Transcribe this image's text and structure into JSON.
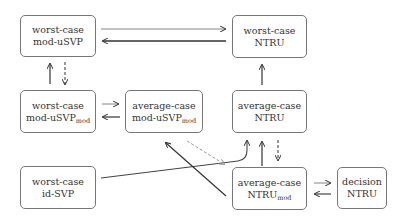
{
  "nodes": {
    "wc_moduSVP": {
      "line1": "worst-case",
      "line2": "mod-uSVP",
      "sub": ""
    },
    "wc_NTRU": {
      "line1": "worst-case",
      "line2": "NTRU",
      "sub": ""
    },
    "wc_moduSVPmod": {
      "line1": "worst-case",
      "line2": "mod-uSVP",
      "sub": "mod"
    },
    "ac_moduSVPmod": {
      "line1": "average-case",
      "line2": "mod-uSVP",
      "sub": "mod"
    },
    "ac_NTRU": {
      "line1": "average-case",
      "line2": "NTRU",
      "sub": ""
    },
    "wc_idSVP": {
      "line1": "worst-case",
      "line2": "id-SVP",
      "sub": ""
    },
    "ac_NTRUmod": {
      "line1": "average-case",
      "line2": "NTRU",
      "sub": "mod"
    },
    "dec_NTRU": {
      "line1": "decision",
      "line2": "NTRU",
      "sub": ""
    }
  },
  "edges": [
    {
      "from": "wc_moduSVP",
      "to": "wc_NTRU",
      "style": "thin"
    },
    {
      "from": "wc_NTRU",
      "to": "wc_moduSVP",
      "style": "thick"
    },
    {
      "from": "wc_moduSVPmod",
      "to": "wc_moduSVP",
      "style": "solid"
    },
    {
      "from": "wc_moduSVP",
      "to": "wc_moduSVPmod",
      "style": "dashed"
    },
    {
      "from": "wc_moduSVPmod",
      "to": "ac_moduSVPmod",
      "style": "thin"
    },
    {
      "from": "ac_moduSVPmod",
      "to": "wc_moduSVPmod",
      "style": "solid"
    },
    {
      "from": "ac_NTRU",
      "to": "wc_NTRU",
      "style": "solid"
    },
    {
      "from": "ac_NTRUmod",
      "to": "ac_NTRU",
      "style": "solid"
    },
    {
      "from": "ac_NTRU",
      "to": "ac_NTRUmod",
      "style": "dashed"
    },
    {
      "from": "wc_idSVP",
      "to": "ac_NTRU",
      "style": "solid"
    },
    {
      "from": "ac_NTRUmod",
      "to": "ac_moduSVPmod",
      "style": "solid"
    },
    {
      "from": "ac_moduSVPmod",
      "to": "ac_NTRUmod",
      "style": "dashed-gray"
    },
    {
      "from": "ac_NTRUmod",
      "to": "dec_NTRU",
      "style": "thin"
    },
    {
      "from": "dec_NTRU",
      "to": "ac_NTRUmod",
      "style": "solid"
    }
  ]
}
